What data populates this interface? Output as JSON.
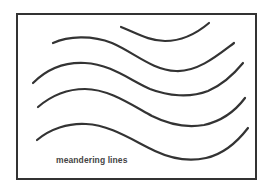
{
  "diagram": {
    "caption": "meandering lines",
    "frame": {
      "stroke_color": "#333333",
      "background": "#ffffff"
    },
    "curves": [
      {
        "id": "curve-1",
        "d": "M 121 27 C 138 34, 150 41, 165 41 C 182 41, 196 34, 209 23"
      },
      {
        "id": "curve-2",
        "d": "M 53 43 C 68 36, 92 35, 112 43 C 135 53, 152 70, 176 71 C 198 72, 218 55, 234 43"
      },
      {
        "id": "curve-3",
        "d": "M 33 83 C 48 68, 66 62, 85 63 C 110 64, 130 80, 150 89 C 168 96, 190 98, 208 91 C 222 85, 234 74, 243 63"
      },
      {
        "id": "curve-4",
        "d": "M 38 107 C 52 95, 68 89, 85 89 C 108 89, 130 104, 152 116 C 168 124, 186 128, 204 125 C 222 121, 236 110, 245 98"
      },
      {
        "id": "curve-5",
        "d": "M 37 140 C 50 129, 68 123, 86 124 C 110 125, 132 140, 155 151 C 170 158, 188 162, 206 158 C 224 154, 238 141, 248 128"
      }
    ]
  }
}
